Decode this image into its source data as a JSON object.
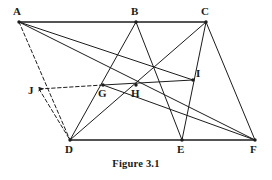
{
  "figure": {
    "caption": "Figure 3.1",
    "stroke_color": "#1c1c1c",
    "label_color": "#1a1a1a",
    "background": "#ffffff"
  },
  "geometry": {
    "points": [
      {
        "id": "A",
        "label": "A",
        "x": 19,
        "y": 22,
        "label_x": 13,
        "label_y": 6,
        "marker": true
      },
      {
        "id": "B",
        "label": "B",
        "x": 136,
        "y": 22,
        "label_x": 131,
        "label_y": 6,
        "marker": true
      },
      {
        "id": "C",
        "label": "C",
        "x": 206,
        "y": 22,
        "label_x": 201,
        "label_y": 6,
        "marker": true
      },
      {
        "id": "D",
        "label": "D",
        "x": 70,
        "y": 140,
        "label_x": 65,
        "label_y": 144,
        "marker": true
      },
      {
        "id": "E",
        "label": "E",
        "x": 182,
        "y": 140,
        "label_x": 177,
        "label_y": 144,
        "marker": true
      },
      {
        "id": "F",
        "label": "F",
        "x": 255,
        "y": 140,
        "label_x": 250,
        "label_y": 144,
        "marker": true
      },
      {
        "id": "G",
        "label": "G",
        "x": 103,
        "y": 85,
        "label_x": 98,
        "label_y": 88,
        "marker": true
      },
      {
        "id": "H",
        "label": "H",
        "x": 136,
        "y": 85,
        "label_x": 131,
        "label_y": 88,
        "marker": true
      },
      {
        "id": "I",
        "label": "I",
        "x": 193,
        "y": 80,
        "label_x": 196,
        "label_y": 68,
        "marker": true
      },
      {
        "id": "J",
        "label": "J",
        "x": 39,
        "y": 89,
        "label_x": 28,
        "label_y": 85,
        "marker": false
      }
    ],
    "segments": [
      {
        "id": "AC",
        "from": "A",
        "to": "C",
        "style": "solid",
        "width": 1.6,
        "arrow": false
      },
      {
        "id": "DF",
        "from": "D",
        "to": "F",
        "style": "solid",
        "width": 1.6,
        "arrow": false
      },
      {
        "id": "AF",
        "from": "A",
        "to": "F",
        "style": "solid",
        "width": 1.0,
        "arrow": false
      },
      {
        "id": "AI",
        "from": "A",
        "to": "I",
        "style": "solid",
        "width": 1.0,
        "arrow": false
      },
      {
        "id": "BD",
        "from": "B",
        "to": "D",
        "style": "solid",
        "width": 1.0,
        "arrow": false
      },
      {
        "id": "BE",
        "from": "B",
        "to": "E",
        "style": "solid",
        "width": 1.0,
        "arrow": false
      },
      {
        "id": "CD",
        "from": "C",
        "to": "D",
        "style": "solid",
        "width": 1.0,
        "arrow": false
      },
      {
        "id": "CE",
        "from": "C",
        "to": "E",
        "style": "solid",
        "width": 1.0,
        "arrow": false
      },
      {
        "id": "CF",
        "from": "C",
        "to": "F",
        "style": "solid",
        "width": 1.0,
        "arrow": false
      },
      {
        "id": "GF",
        "from": "G",
        "to": "F",
        "style": "solid",
        "width": 1.0,
        "arrow": false
      },
      {
        "id": "GI",
        "from": "G",
        "to": "I",
        "style": "solid",
        "width": 1.0,
        "arrow": false
      },
      {
        "id": "AD",
        "from": "A",
        "to": "D",
        "style": "dashed",
        "width": 1.0,
        "arrow": false
      },
      {
        "id": "GJ",
        "from": "G",
        "to": "J",
        "style": "dashed",
        "width": 1.0,
        "arrow": true
      },
      {
        "id": "JD",
        "from": "J",
        "to": "D",
        "style": "dashed",
        "width": 1.0,
        "arrow": false
      }
    ]
  }
}
